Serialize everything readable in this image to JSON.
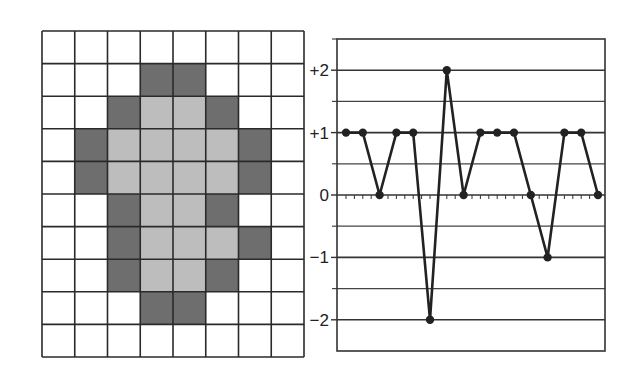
{
  "grid": {
    "columns": 8,
    "rows": 10,
    "legend": {
      "0": "empty",
      "1": "dark",
      "2": "light"
    },
    "colors": {
      "empty": "#ffffff",
      "dark": "#6e6e6e",
      "light": "#bdbdbd",
      "line": "#2a2a2a"
    },
    "cells": [
      [
        0,
        0,
        0,
        0,
        0,
        0,
        0,
        0
      ],
      [
        0,
        0,
        0,
        1,
        1,
        0,
        0,
        0
      ],
      [
        0,
        0,
        1,
        2,
        2,
        1,
        0,
        0
      ],
      [
        0,
        1,
        2,
        2,
        2,
        2,
        1,
        0
      ],
      [
        0,
        1,
        2,
        2,
        2,
        2,
        1,
        0
      ],
      [
        0,
        0,
        1,
        2,
        2,
        1,
        0,
        0
      ],
      [
        0,
        0,
        1,
        2,
        2,
        2,
        1,
        0
      ],
      [
        0,
        0,
        1,
        2,
        2,
        1,
        0,
        0
      ],
      [
        0,
        0,
        0,
        1,
        1,
        0,
        0,
        0
      ],
      [
        0,
        0,
        0,
        0,
        0,
        0,
        0,
        0
      ]
    ]
  },
  "chart_data": {
    "type": "line",
    "title": "",
    "xlabel": "",
    "ylabel": "",
    "x": [
      1,
      2,
      3,
      4,
      5,
      6,
      7,
      8,
      9,
      10,
      11,
      12,
      13,
      14,
      15,
      16
    ],
    "series": [
      {
        "name": "values",
        "values": [
          1,
          1,
          0,
          1,
          1,
          -2,
          2,
          0,
          1,
          1,
          1,
          0,
          -1,
          1,
          1,
          0
        ]
      }
    ],
    "ylim": [
      -2.5,
      2.5
    ],
    "yticks": [
      2,
      1,
      0,
      -1,
      -2
    ],
    "ytick_labels": [
      "+2",
      "+1",
      "0",
      "−1",
      "−2"
    ],
    "minor_gridlines": [
      2.5,
      1.5,
      0.5,
      -0.5,
      -1.5
    ],
    "grid": true,
    "legend": "none",
    "color": "#222222"
  }
}
